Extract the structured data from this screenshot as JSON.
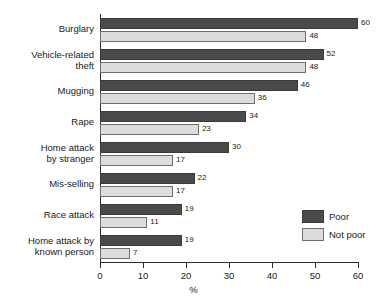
{
  "chart_data": {
    "type": "bar",
    "orientation": "horizontal",
    "title": "",
    "xlabel": "%",
    "ylabel": "",
    "xlim": [
      0,
      60
    ],
    "xticks": [
      0,
      10,
      20,
      30,
      40,
      50,
      60
    ],
    "grid": false,
    "legend_position": "inside-right",
    "categories": [
      "Burglary",
      "Vehicle-related\ntheft",
      "Mugging",
      "Rape",
      "Home attack\nby stranger",
      "Mis-selling",
      "Race attack",
      "Home attack by\nknown person"
    ],
    "series": [
      {
        "name": "Poor",
        "color": "#4a4a4a",
        "values": [
          60,
          52,
          46,
          34,
          30,
          22,
          19,
          19
        ]
      },
      {
        "name": "Not poor",
        "color": "#dcdcdc",
        "values": [
          48,
          48,
          36,
          23,
          17,
          17,
          11,
          7
        ]
      }
    ]
  },
  "legend": {
    "items": [
      {
        "label": "Poor",
        "kind": "poor"
      },
      {
        "label": "Not poor",
        "kind": "notpoor"
      }
    ]
  }
}
